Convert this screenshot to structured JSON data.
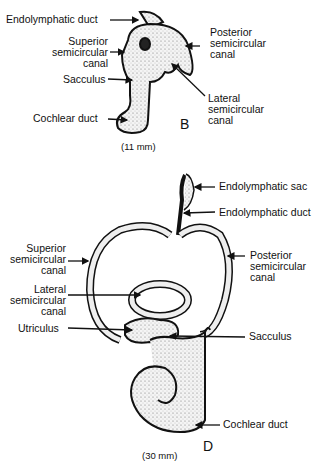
{
  "figure_b": {
    "panel_letter": "B",
    "scale": "(11 mm)",
    "labels": {
      "endolymphatic_duct": "Endolymphatic duct",
      "superior_canal": "Superior\nsemicircular\ncanal",
      "posterior_canal": "Posterior\nsemicircular\ncanal",
      "sacculus": "Sacculus",
      "lateral_canal": "Lateral\nsemicircular\ncanal",
      "cochlear_duct": "Cochlear duct"
    }
  },
  "figure_d": {
    "panel_letter": "D",
    "scale": "(30 mm)",
    "labels": {
      "endolymphatic_sac": "Endolymphatic sac",
      "endolymphatic_duct": "Endolymphatic duct",
      "superior_canal": "Superior\nsemicircular\ncanal",
      "posterior_canal": "Posterior\nsemicircular\ncanal",
      "lateral_canal": "Lateral\nsemicircular\ncanal",
      "utriculus": "Utriculus",
      "sacculus": "Sacculus",
      "cochlear_duct": "Cochlear duct"
    }
  }
}
